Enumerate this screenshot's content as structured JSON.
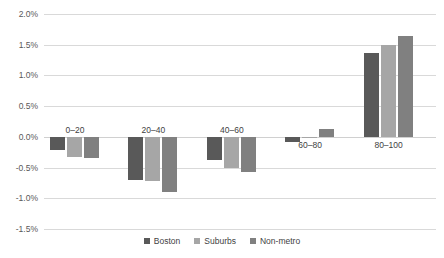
{
  "chart_data": {
    "type": "bar",
    "title": "",
    "xlabel": "",
    "ylabel": "",
    "ylim": [
      -1.5,
      2.0
    ],
    "ytick_step": 0.5,
    "yticks": [
      "2.0%",
      "1.5%",
      "1.0%",
      "0.5%",
      "0.0%",
      "-0.5%",
      "-1.0%",
      "-1.5%"
    ],
    "ytick_values": [
      2.0,
      1.5,
      1.0,
      0.5,
      0.0,
      -0.5,
      -1.0,
      -1.5
    ],
    "grid": true,
    "legend_position": "bottom",
    "categories": [
      "0–20",
      "20–40",
      "40–60",
      "60–80",
      "80–100"
    ],
    "series": [
      {
        "name": "Boston",
        "color": "#595959",
        "values": [
          -0.22,
          -0.7,
          -0.38,
          -0.08,
          1.37
        ]
      },
      {
        "name": "Suburbs",
        "color": "#a6a6a6",
        "values": [
          -0.32,
          -0.72,
          -0.5,
          -0.02,
          1.5
        ]
      },
      {
        "name": "Non-metro",
        "color": "#808080",
        "values": [
          -0.35,
          -0.9,
          -0.58,
          0.13,
          1.65
        ]
      }
    ]
  }
}
